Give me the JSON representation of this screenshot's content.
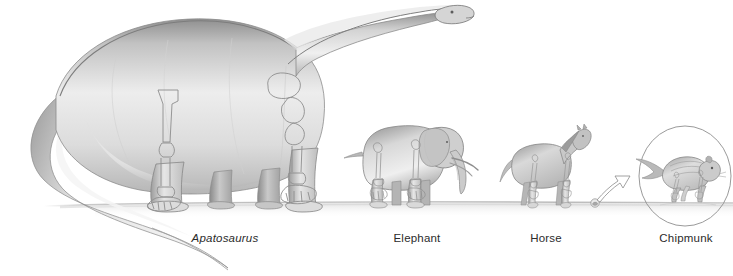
{
  "figure": {
    "style": "grayscale pencil illustration with skeletal limb bones overlaid",
    "background_color": "#ffffff",
    "ink_color": "#4a4a4a",
    "body_fill_light": "#f2f2f2",
    "body_fill_mid": "#d6d6d6",
    "body_fill_dark": "#9a9a9a",
    "bone_outline_color": "#8d8d8d",
    "ground_line_color": "#b9b9b9",
    "label_color": "#2b2b2b"
  },
  "labels": [
    {
      "id": "apatosaurus",
      "text": "Apatosaurus",
      "italic": true,
      "x": 225,
      "y": 232
    },
    {
      "id": "elephant",
      "text": "Elephant",
      "italic": false,
      "x": 417,
      "y": 232
    },
    {
      "id": "horse",
      "text": "Horse",
      "italic": false,
      "x": 546,
      "y": 232
    },
    {
      "id": "chipmunk",
      "text": "Chipmunk",
      "italic": false,
      "x": 686,
      "y": 232
    }
  ],
  "animals": [
    {
      "id": "apatosaurus",
      "name": "Apatosaurus",
      "label": "Apatosaurus",
      "facing": "right",
      "shown_to_scale": true,
      "magnified": false,
      "approx_height_px": 205,
      "approx_length_px": 480,
      "features": [
        "long neck",
        "small head",
        "long tapering tail",
        "four columnar legs",
        "forelimb bones",
        "hindlimb bones",
        "pelvis outline"
      ]
    },
    {
      "id": "elephant",
      "name": "Elephant",
      "label": "Elephant",
      "facing": "right",
      "shown_to_scale": true,
      "magnified": false,
      "approx_height_px": 78,
      "approx_length_px": 110,
      "features": [
        "trunk",
        "tusks",
        "large ears",
        "tail",
        "forelimb bones",
        "hindlimb bones"
      ]
    },
    {
      "id": "horse",
      "name": "Horse",
      "label": "Horse",
      "facing": "right",
      "shown_to_scale": true,
      "magnified": false,
      "approx_height_px": 52,
      "approx_length_px": 78,
      "features": [
        "mane",
        "tail",
        "slender legs",
        "leg bones"
      ]
    },
    {
      "id": "chipmunk",
      "name": "Chipmunk",
      "label": "Chipmunk",
      "facing": "right",
      "shown_to_scale": false,
      "magnified": true,
      "actual_size_px": 8,
      "magnifier_circle_diameter_px": 92,
      "features": [
        "bushy tail",
        "striped back",
        "running pose",
        "leg bones",
        "callout arrow from actual-size figure to magnified circle"
      ]
    }
  ],
  "ground": {
    "id": "ground-line",
    "description": "faint horizontal ground line the animals stand on",
    "y": 205,
    "x_start": 44,
    "x_end": 733
  },
  "callout": {
    "id": "magnifier-callout",
    "description": "curved outline arrow pointing from the actual-size chipmunk up-right into the magnified circle",
    "from_x": 595,
    "from_y": 202,
    "to_x": 628,
    "to_y": 176
  }
}
